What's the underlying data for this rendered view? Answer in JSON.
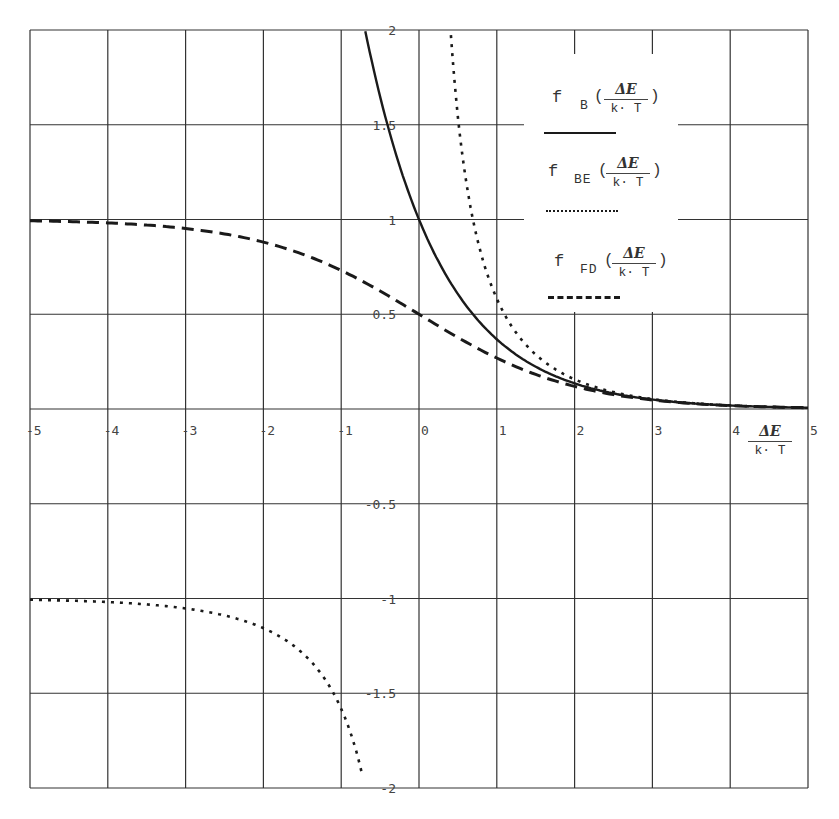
{
  "chart_data": {
    "type": "line",
    "title": "",
    "xlabel": "ΔE / (k·T)",
    "ylabel": "",
    "xlim": [
      -5,
      5
    ],
    "ylim": [
      -2,
      2
    ],
    "grid": true,
    "x_ticks": [
      -5,
      -4,
      -3,
      -2,
      -1,
      0,
      1,
      2,
      3,
      4,
      5
    ],
    "x_tick_labels": [
      "-5",
      "-4",
      "-3",
      "-2",
      "-1",
      "0",
      "1",
      "2",
      "3",
      "4",
      "5"
    ],
    "y_ticks": [
      2,
      1.5,
      1,
      0.5,
      -0.5,
      -1,
      -1.5,
      -2
    ],
    "y_tick_labels": [
      "2",
      "1.5",
      "1",
      "0.5",
      "-0.5",
      "-1",
      "-1.5",
      "-2"
    ],
    "legend_position": "upper right",
    "series": [
      {
        "name": "f_B(ΔE/(k·T))",
        "function": "exp(-x)",
        "style": "solid",
        "x": [
          -0.69,
          -0.5,
          -0.25,
          0,
          0.25,
          0.5,
          0.75,
          1,
          1.5,
          2,
          2.5,
          3,
          3.5,
          4,
          4.5,
          5
        ],
        "values": [
          2.0,
          1.649,
          1.284,
          1.0,
          0.779,
          0.607,
          0.472,
          0.368,
          0.223,
          0.135,
          0.082,
          0.05,
          0.03,
          0.018,
          0.011,
          0.007
        ]
      },
      {
        "name": "f_BE(ΔE/(k·T))",
        "function": "1/(exp(x)-1)",
        "style": "dotted",
        "x": [
          0.41,
          0.5,
          0.75,
          1,
          1.5,
          2,
          2.5,
          3,
          3.5,
          4,
          4.5,
          5
        ],
        "values": [
          1.97,
          1.541,
          0.895,
          0.582,
          0.287,
          0.157,
          0.089,
          0.052,
          0.031,
          0.019,
          0.011,
          0.007
        ],
        "x_neg": [
          -5,
          -4,
          -3,
          -2,
          -1.5,
          -1.25,
          -1,
          -0.9,
          -0.8,
          -0.74
        ],
        "values_neg": [
          -1.007,
          -1.019,
          -1.052,
          -1.157,
          -1.287,
          -1.401,
          -1.582,
          -1.685,
          -1.816,
          -1.91
        ]
      },
      {
        "name": "f_FD(ΔE/(k·T))",
        "function": "1/(exp(x)+1)",
        "style": "dashed",
        "x": [
          -5,
          -4,
          -3,
          -2,
          -1.5,
          -1,
          -0.5,
          0,
          0.5,
          1,
          1.5,
          2,
          2.5,
          3,
          4,
          5
        ],
        "values": [
          0.993,
          0.982,
          0.953,
          0.881,
          0.818,
          0.731,
          0.622,
          0.5,
          0.378,
          0.269,
          0.182,
          0.119,
          0.076,
          0.047,
          0.018,
          0.007
        ]
      }
    ]
  },
  "legend": {
    "items": [
      {
        "f": "f",
        "sub": "B",
        "num": "ΔE",
        "den": "k· T",
        "style": "solid"
      },
      {
        "f": "f",
        "sub": "BE",
        "num": "ΔE",
        "den": "k· T",
        "style": "dotted"
      },
      {
        "f": "f",
        "sub": "FD",
        "num": "ΔE",
        "den": "k· T",
        "style": "dashed"
      }
    ]
  },
  "axis_label": {
    "num": "ΔE",
    "den": "k· T"
  },
  "colors": {
    "line": "#1a1a1a",
    "grid": "#333333",
    "text": "#444444"
  }
}
